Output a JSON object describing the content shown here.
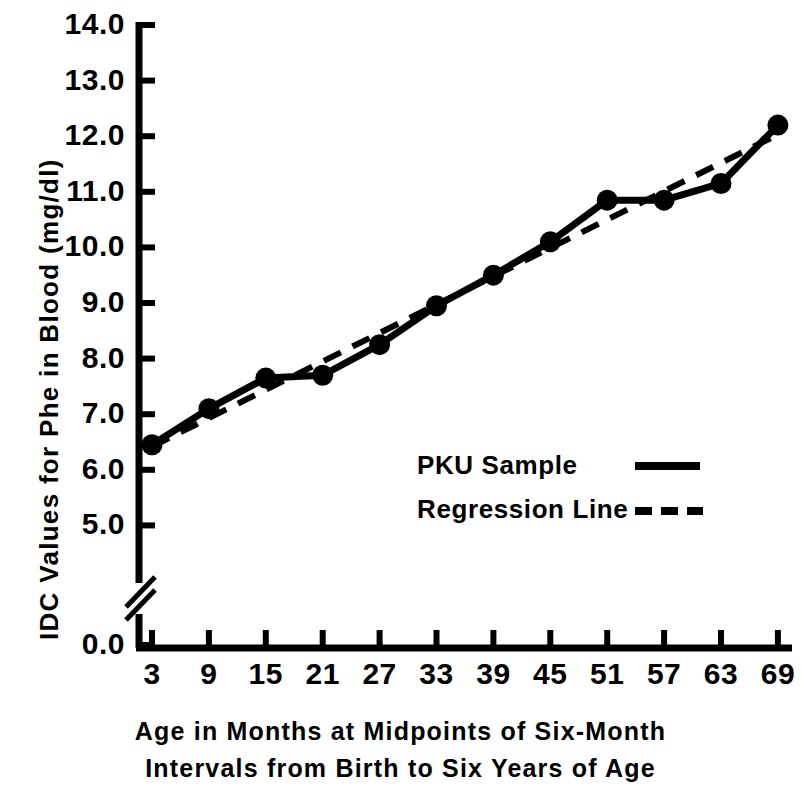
{
  "chart_data": {
    "type": "line",
    "title": "",
    "xlabel": "Age in Months at Midpoints of Six-Month Intervals from Birth to Six Years of Age",
    "ylabel": "IDC Values for Phe in Blood (mg/dl)",
    "x": [
      3,
      9,
      15,
      21,
      27,
      33,
      39,
      45,
      51,
      57,
      63,
      69
    ],
    "xtick_labels": [
      "3",
      "9",
      "15",
      "21",
      "27",
      "33",
      "39",
      "45",
      "51",
      "57",
      "63",
      "69"
    ],
    "ytick_labels": [
      "14.0",
      "13.0",
      "12.0",
      "11.0",
      "10.0",
      "9.0",
      "8.0",
      "7.0",
      "6.0",
      "5.0",
      "0.0"
    ],
    "ytick_values": [
      14.0,
      13.0,
      12.0,
      11.0,
      10.0,
      9.0,
      8.0,
      7.0,
      6.0,
      5.0,
      0.0
    ],
    "ylim": [
      4.6,
      14.0
    ],
    "xlim": [
      0,
      72
    ],
    "axis_break": true,
    "axis_break_between": [
      5.0,
      0.0
    ],
    "grid": false,
    "legend_position": "center-right-inside",
    "series": [
      {
        "name": "PKU Sample",
        "style": "solid",
        "marker": "filled-circle",
        "values": [
          6.45,
          7.1,
          7.65,
          7.7,
          8.25,
          8.95,
          9.5,
          10.1,
          10.85,
          10.85,
          11.15,
          12.2
        ]
      },
      {
        "name": "Regression Line",
        "style": "dashed",
        "marker": "none",
        "values": [
          6.42,
          6.93,
          7.44,
          7.95,
          8.46,
          8.97,
          9.48,
          9.99,
          10.5,
          11.01,
          11.52,
          12.03
        ]
      }
    ]
  },
  "legend": {
    "entries": [
      {
        "label": "PKU Sample",
        "style": "solid"
      },
      {
        "label": "Regression Line",
        "style": "dashed"
      }
    ]
  },
  "axes": {
    "y_title": "IDC Values for Phe in Blood (mg/dl)",
    "x_title_line1": "Age in Months at Midpoints of Six-Month",
    "x_title_line2": "Intervals from Birth to Six Years of Age"
  },
  "colors": {
    "foreground": "#000000",
    "background": "#ffffff"
  }
}
